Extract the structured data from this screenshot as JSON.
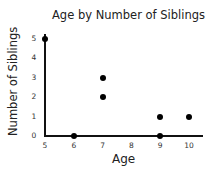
{
  "chart_data": {
    "type": "scatter",
    "title": "Age by Number of Siblings",
    "xlabel": "Age",
    "ylabel": "Number of Siblings",
    "x_ticks": [
      "5",
      "6",
      "7",
      "8",
      "9",
      "10"
    ],
    "y_ticks": [
      "0",
      "1",
      "2",
      "3",
      "4",
      "5"
    ],
    "xlim": [
      5,
      10.5
    ],
    "ylim": [
      0,
      5
    ],
    "grid": false,
    "legend": null,
    "points": [
      {
        "x": 5,
        "y": 5
      },
      {
        "x": 6,
        "y": 0
      },
      {
        "x": 7,
        "y": 3
      },
      {
        "x": 7,
        "y": 2
      },
      {
        "x": 9,
        "y": 1
      },
      {
        "x": 9,
        "y": 0
      },
      {
        "x": 10,
        "y": 1
      }
    ]
  }
}
